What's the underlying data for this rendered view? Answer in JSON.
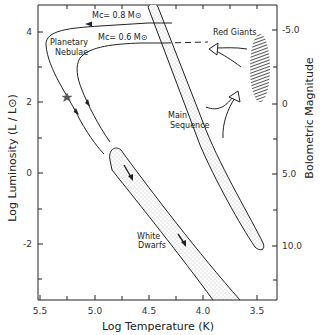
{
  "diagram": {
    "type": "Hertzsprung-Russell diagram",
    "x_axis": {
      "label": "Log Temperature (K)",
      "ticks": [
        "5.5",
        "5.0",
        "4.5",
        "4.0",
        "3.5"
      ]
    },
    "y_axis_left": {
      "label": "Log Luminosity (L / L⊙)",
      "ticks": [
        "4",
        "2",
        "0",
        "-2"
      ]
    },
    "y_axis_right": {
      "label": "Bolometric Magnitude",
      "ticks": [
        "-5.0",
        "0",
        "5.0",
        "10.0"
      ]
    },
    "annotations": {
      "track_high": "Mc= 0.8 M⊙",
      "track_low": "Mc= 0.6 M⊙",
      "planetary_line1": "Planetary",
      "planetary_line2": "Nebulae",
      "red_giants": "Red Giants",
      "main_line1": "Main",
      "main_line2": "Sequence",
      "white_line1": "White",
      "white_line2": "Dwarfs"
    },
    "colors": {
      "ink": "#222222",
      "stipple": "#9a9a9a",
      "background": "#ffffff"
    }
  }
}
